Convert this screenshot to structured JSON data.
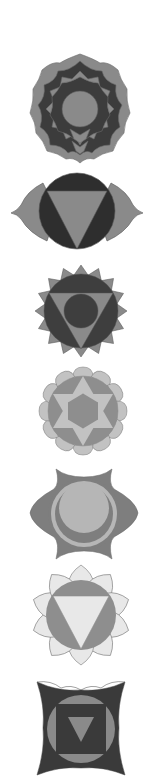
{
  "title": "Seven Chakra Symbols",
  "colors": {
    "dark": "#3a3a3a",
    "mid": "#7a7a7a",
    "midlight": "#9a9a9a",
    "light": "#bdbdbd",
    "pale": "#e6e6e6",
    "outline": "#6a6a6a",
    "background": "#ffffff"
  },
  "symbols": [
    {
      "name": "crown",
      "petals": "many-layered lotus",
      "center": "circle"
    },
    {
      "name": "third-eye",
      "petals": 2,
      "center": "inverted triangle in circle"
    },
    {
      "name": "throat",
      "petals": 16,
      "center": "circle in inverted triangle in circle"
    },
    {
      "name": "heart",
      "petals": 12,
      "center": "hexagram in circle"
    },
    {
      "name": "sacral",
      "petals": 6,
      "center": "crescent moon in circle"
    },
    {
      "name": "solar-plexus",
      "petals": 10,
      "center": "inverted triangle in circle"
    },
    {
      "name": "root",
      "petals": 4,
      "center": "inverted triangle in square in circle"
    }
  ]
}
